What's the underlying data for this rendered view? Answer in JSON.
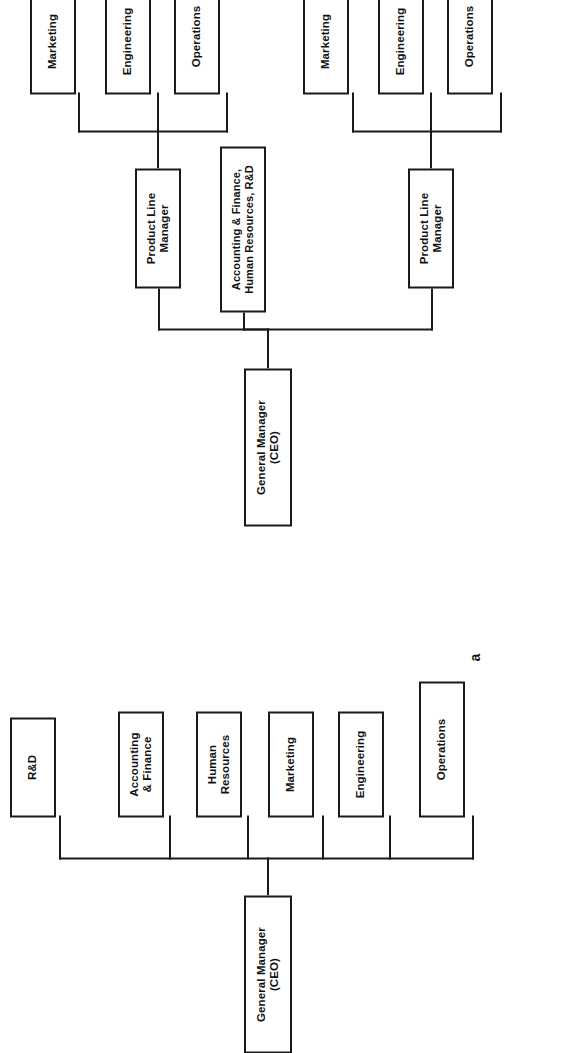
{
  "figure": {
    "type": "organizational-chart",
    "panels": [
      {
        "id": "a",
        "caption": "a",
        "title": "Functional organizational structure",
        "root": {
          "line1": "General Manager",
          "line2": "(CEO)"
        },
        "children": [
          {
            "line1": "Operations",
            "line2": ""
          },
          {
            "line1": "Engineering",
            "line2": ""
          },
          {
            "line1": "Marketing",
            "line2": ""
          },
          {
            "line1": "Human",
            "line2": "Resources"
          },
          {
            "line1": "Accounting",
            "line2": "& Finance"
          },
          {
            "line1": "R&D",
            "line2": ""
          }
        ]
      },
      {
        "id": "b",
        "caption": "b",
        "title": "Product line organizational structure",
        "root": {
          "line1": "General Manager",
          "line2": "(CEO)"
        },
        "staff": {
          "line1": "Accounting & Finance,",
          "line2": "Human Resources, R&D"
        },
        "managers": [
          {
            "label": {
              "line1": "Product Line",
              "line2": "Manager"
            },
            "children": [
              {
                "line1": "Operations",
                "line2": ""
              },
              {
                "line1": "Engineering",
                "line2": ""
              },
              {
                "line1": "Marketing",
                "line2": ""
              }
            ]
          },
          {
            "label": {
              "line1": "Product Line",
              "line2": "Manager"
            },
            "children": [
              {
                "line1": "Operations",
                "line2": ""
              },
              {
                "line1": "Engineering",
                "line2": ""
              },
              {
                "line1": "Marketing",
                "line2": ""
              }
            ]
          }
        ]
      }
    ],
    "colors": {
      "line": "#1a1a1a",
      "box_fill": "#ffffff",
      "text": "#111111"
    }
  }
}
